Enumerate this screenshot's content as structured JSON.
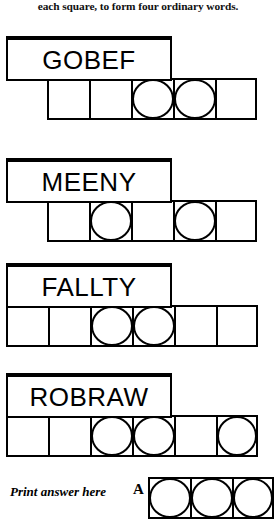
{
  "instruction": {
    "text": "each square, to form four ordinary words."
  },
  "puzzles": [
    {
      "word": "GOBEF",
      "box": {
        "left": 6,
        "top": 36,
        "width": 166,
        "height": 45
      },
      "grid": {
        "left": 47,
        "top": 78,
        "cell": 42,
        "count": 5
      },
      "circled": [
        3,
        4
      ]
    },
    {
      "word": "MEENY",
      "box": {
        "left": 6,
        "top": 158,
        "width": 166,
        "height": 45
      },
      "grid": {
        "left": 47,
        "top": 200,
        "cell": 42,
        "count": 5
      },
      "circled": [
        2,
        4
      ]
    },
    {
      "word": "FALLTY",
      "box": {
        "left": 6,
        "top": 263,
        "width": 166,
        "height": 45
      },
      "grid": {
        "left": 6,
        "top": 305,
        "cell": 42,
        "count": 6
      },
      "circled": [
        3,
        4
      ]
    },
    {
      "word": "ROBRAW",
      "box": {
        "left": 6,
        "top": 373,
        "width": 166,
        "height": 45
      },
      "grid": {
        "left": 6,
        "top": 415,
        "cell": 42,
        "count": 6
      },
      "circled": [
        3,
        4,
        6
      ]
    }
  ],
  "answer": {
    "label": "Print answer here",
    "label_left": 10,
    "label_top": 484,
    "letter": "A",
    "letter_left": 133,
    "letter_top": 481,
    "grid": {
      "left": 148,
      "top": 477,
      "cell": 42,
      "count": 3
    },
    "circled": [
      1,
      2,
      3
    ]
  },
  "colors": {
    "ink": "#000000",
    "paper": "#ffffff"
  }
}
